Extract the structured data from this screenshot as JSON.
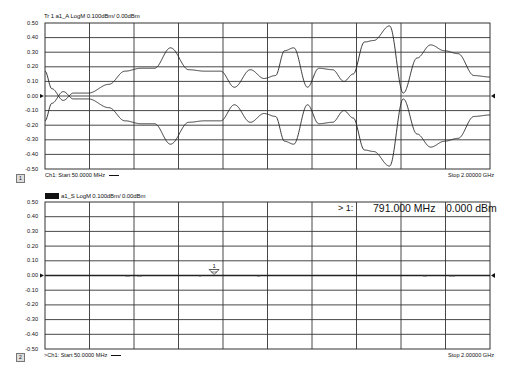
{
  "panels": [
    {
      "id": "tr1",
      "title": "Tr 1  a1_A LogM 0.100dBm/  0.00dBm",
      "channel_indicator": "1",
      "start_label": "Ch1: Start  50.0000 MHz",
      "stop_label": "Stop  2.00000 GHz",
      "y_tick_labels": [
        "0.50",
        "0.40",
        "0.30",
        "0.20",
        "0.10",
        "0.00",
        "-0.10",
        "-0.20",
        "-0.30",
        "-0.40",
        "-0.50"
      ]
    },
    {
      "id": "tr2",
      "title": "a1_S LogM 0.100dBm/  0.00dBm",
      "channel_indicator": "2",
      "start_label": ">Ch1: Start  50.0000 MHz",
      "stop_label": "Stop  2.00000 GHz",
      "y_tick_labels": [
        "0.50",
        "0.40",
        "0.30",
        "0.20",
        "0.10",
        "0.00",
        "-0.10",
        "-0.20",
        "-0.30",
        "-0.40",
        "-0.50"
      ],
      "marker": {
        "label": "> 1:",
        "frequency": "791.000 MHz",
        "value": "0.000 dBm",
        "marker_number": "1"
      }
    }
  ],
  "colors": {
    "trace": "#222222",
    "grid": "#333333",
    "background": "#ffffff"
  },
  "chart_data": [
    {
      "type": "line",
      "title": "Tr 1  a1_A LogM 0.100dBm/  0.00dBm",
      "xlabel": "Frequency",
      "ylabel": "dBm",
      "x_range_mhz": [
        50,
        2000
      ],
      "ylim": [
        -0.5,
        0.5
      ],
      "y_ticks": [
        0.5,
        0.4,
        0.3,
        0.2,
        0.1,
        0.0,
        -0.1,
        -0.2,
        -0.3,
        -0.4,
        -0.5
      ],
      "grid": true,
      "x_divisions": 10,
      "y_divisions": 10,
      "reference_level": 0.0,
      "scale_per_div": "0.100 dBm",
      "series": [
        {
          "name": "a1_A upper",
          "x_mhz": [
            50,
            60,
            70,
            80,
            90,
            100,
            110,
            120,
            130,
            140,
            150,
            160,
            170,
            180,
            190,
            200,
            210,
            220,
            230,
            240,
            250,
            260,
            270,
            280,
            290,
            300,
            310,
            320,
            330,
            340,
            350,
            360,
            370,
            380,
            390,
            400,
            410,
            420,
            430,
            440,
            450,
            460,
            470,
            480,
            490,
            500,
            510,
            520,
            530,
            540,
            550,
            560,
            570,
            580,
            590,
            600,
            610,
            620,
            630,
            640,
            650,
            660,
            670,
            680,
            690,
            700,
            710,
            720,
            730,
            740,
            750,
            760,
            770,
            780,
            790,
            800,
            810,
            820,
            830,
            840,
            850,
            860,
            870,
            880,
            890,
            900,
            910,
            920,
            930,
            940,
            950,
            960,
            970,
            980,
            990,
            1000,
            1010,
            1020,
            1030,
            1040,
            1050,
            1060,
            1070,
            1080,
            1090,
            1100,
            1110,
            1120,
            1130,
            1140,
            1150,
            1160,
            1170,
            1180,
            1190,
            1200,
            1210,
            1220,
            1230,
            1240,
            1250,
            1260,
            1270,
            1280,
            1290,
            1300,
            1310,
            1320,
            1330,
            1340,
            1350,
            1360,
            1370,
            1380,
            1390,
            1400,
            1410,
            1420,
            1430,
            1440,
            1450,
            1460,
            1470,
            1480,
            1490,
            1500,
            1510,
            1520,
            1530,
            1540,
            1550,
            1560,
            1570,
            1580,
            1590,
            1600,
            1610,
            1620,
            1630,
            1640,
            1650,
            1660,
            1670,
            1680,
            1690,
            1700,
            1710,
            1720,
            1730,
            1740,
            1750,
            1760,
            1770,
            1780,
            1790,
            1800,
            1810,
            1820,
            1830,
            1840,
            1850,
            1860,
            1870,
            1880,
            1890,
            1900,
            1910,
            1920,
            1930,
            1940,
            1950,
            1960,
            1970,
            1980,
            1990,
            2000
          ],
          "envelope_note": "oscillating trace; envelope values (dBm) at peaks described in peaks[]",
          "peaks": [
            {
              "x_mhz": 50,
              "y": 0.17
            },
            {
              "x_mhz": 80,
              "y": 0.05
            },
            {
              "x_mhz": 130,
              "y": -0.03
            },
            {
              "x_mhz": 175,
              "y": 0.02
            },
            {
              "x_mhz": 240,
              "y": 0.02
            },
            {
              "x_mhz": 330,
              "y": 0.08
            },
            {
              "x_mhz": 400,
              "y": 0.17
            },
            {
              "x_mhz": 470,
              "y": 0.19
            },
            {
              "x_mhz": 530,
              "y": 0.19
            },
            {
              "x_mhz": 600,
              "y": 0.33
            },
            {
              "x_mhz": 680,
              "y": 0.18
            },
            {
              "x_mhz": 750,
              "y": 0.17
            },
            {
              "x_mhz": 820,
              "y": 0.17
            },
            {
              "x_mhz": 880,
              "y": 0.06
            },
            {
              "x_mhz": 950,
              "y": 0.18
            },
            {
              "x_mhz": 1010,
              "y": 0.12
            },
            {
              "x_mhz": 1060,
              "y": 0.14
            },
            {
              "x_mhz": 1100,
              "y": 0.31
            },
            {
              "x_mhz": 1140,
              "y": 0.33
            },
            {
              "x_mhz": 1200,
              "y": 0.06
            },
            {
              "x_mhz": 1250,
              "y": 0.19
            },
            {
              "x_mhz": 1310,
              "y": 0.18
            },
            {
              "x_mhz": 1360,
              "y": 0.1
            },
            {
              "x_mhz": 1400,
              "y": 0.15
            },
            {
              "x_mhz": 1450,
              "y": 0.37
            },
            {
              "x_mhz": 1490,
              "y": 0.38
            },
            {
              "x_mhz": 1560,
              "y": 0.48
            },
            {
              "x_mhz": 1620,
              "y": 0.02
            },
            {
              "x_mhz": 1680,
              "y": 0.26
            },
            {
              "x_mhz": 1740,
              "y": 0.35
            },
            {
              "x_mhz": 1800,
              "y": 0.31
            },
            {
              "x_mhz": 1860,
              "y": 0.29
            },
            {
              "x_mhz": 1930,
              "y": 0.14
            },
            {
              "x_mhz": 2000,
              "y": 0.13
            }
          ]
        },
        {
          "name": "a1_A lower",
          "note": "mirror image of upper trace about 0.00 dBm"
        }
      ]
    },
    {
      "type": "line",
      "title": "a1_S LogM 0.100dBm/  0.00dBm",
      "xlabel": "Frequency",
      "ylabel": "dBm",
      "x_range_mhz": [
        50,
        2000
      ],
      "ylim": [
        -0.5,
        0.5
      ],
      "y_ticks": [
        0.5,
        0.4,
        0.3,
        0.2,
        0.1,
        0.0,
        -0.1,
        -0.2,
        -0.3,
        -0.4,
        -0.5
      ],
      "grid": true,
      "x_divisions": 10,
      "y_divisions": 10,
      "reference_level": 0.0,
      "scale_per_div": "0.100 dBm",
      "series": [
        {
          "name": "a1_S",
          "x_mhz": [
            50,
            2000
          ],
          "y": [
            0.0,
            0.0
          ]
        }
      ],
      "annotations": [
        {
          "type": "marker",
          "number": 1,
          "x_mhz": 791.0,
          "y": 0.0,
          "readout": "> 1:  791.000 MHz  0.000 dBm"
        }
      ]
    }
  ]
}
